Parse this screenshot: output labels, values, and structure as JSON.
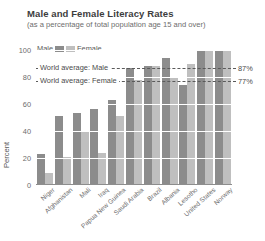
{
  "header": {
    "title": "Male and Female Literacy Rates",
    "subtitle": "(as a percentage of total population age 15 and over)"
  },
  "legend": {
    "male_label": "Male",
    "female_label": "Female",
    "male_color": "#8c8c8c",
    "female_color": "#bfbfbf"
  },
  "annotations": {
    "male_avg_label": "World average: Male",
    "male_avg_value_label": "87%",
    "female_avg_label": "World average: Female",
    "female_avg_value_label": "77%"
  },
  "chart_data": {
    "type": "bar",
    "title": "Male and Female Literacy Rates",
    "subtitle": "(as a percentage of total population age 15 and over)",
    "xlabel": "",
    "ylabel": "Percent",
    "ylim": [
      0,
      100
    ],
    "yticks": [
      0,
      20,
      40,
      60,
      80,
      100
    ],
    "ytick_labels": [
      "0",
      "20",
      "40",
      "60",
      "80",
      "100"
    ],
    "grid": true,
    "legend_position": "top-left",
    "categories": [
      "Niger",
      "Afghanistan",
      "Mali",
      "Iraq",
      "Papua New Guinea",
      "Saudi Arabia",
      "Brazil",
      "Albania",
      "Lesotho",
      "United States",
      "Norway"
    ],
    "series": [
      {
        "name": "Male",
        "color": "#8c8c8c",
        "values": [
          23,
          51,
          53,
          56,
          63,
          87,
          88,
          94,
          74,
          99,
          100
        ]
      },
      {
        "name": "Female",
        "color": "#bfbfbf",
        "values": [
          9,
          21,
          40,
          24,
          51,
          78,
          88,
          79,
          90,
          99,
          100
        ]
      }
    ],
    "reference_lines": [
      {
        "label": "World average: Male",
        "value": 87,
        "value_label": "87%",
        "style": "dashed"
      },
      {
        "label": "World average: Female",
        "value": 77,
        "value_label": "77%",
        "style": "dashed"
      }
    ]
  }
}
